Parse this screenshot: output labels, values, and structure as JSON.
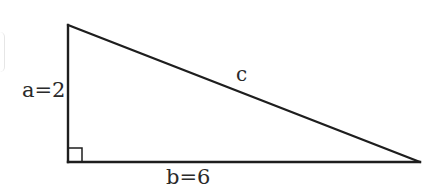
{
  "diagram": {
    "type": "right-triangle",
    "title": "",
    "stroke_color": "#1e1e1e",
    "vertices": {
      "top": {
        "x": 68,
        "y": 25
      },
      "bottom_left": {
        "x": 68,
        "y": 162
      },
      "bottom_right": {
        "x": 420,
        "y": 162
      }
    },
    "right_angle_marker": {
      "corner": "bottom_left",
      "size": 14
    },
    "sides": {
      "a": {
        "label": "a=2",
        "name": "a",
        "value": 2,
        "position": "left vertical leg"
      },
      "b": {
        "label": "b=6",
        "name": "b",
        "value": 6,
        "position": "bottom horizontal leg"
      },
      "c": {
        "label": "c",
        "name": "c",
        "value": null,
        "position": "hypotenuse"
      }
    }
  }
}
